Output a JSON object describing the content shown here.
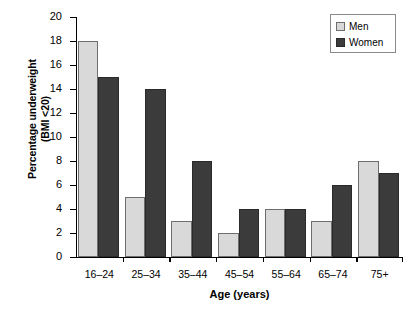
{
  "chart_data": {
    "type": "bar",
    "title": "",
    "xlabel": "Age (years)",
    "ylabel": "Percentage underweight (BMI <20)",
    "ylabel_line1": "Percentage underweight",
    "ylabel_line2": "(BMI <20)",
    "categories": [
      "16–24",
      "25–34",
      "35–44",
      "45–54",
      "55–64",
      "65–74",
      "75+"
    ],
    "series": [
      {
        "name": "Men",
        "color": "#d9d9d9",
        "values": [
          18,
          5,
          3,
          2,
          4,
          3,
          8
        ]
      },
      {
        "name": "Women",
        "color": "#3b3b3b",
        "values": [
          15,
          14,
          8,
          4,
          4,
          6,
          7
        ]
      }
    ],
    "ylim": [
      0,
      20
    ],
    "ytick_step": 2,
    "yticks": [
      "0",
      "2",
      "4",
      "6",
      "8",
      "10",
      "12",
      "14",
      "16",
      "18",
      "20"
    ],
    "grid": false,
    "legend_position": "top-right"
  }
}
